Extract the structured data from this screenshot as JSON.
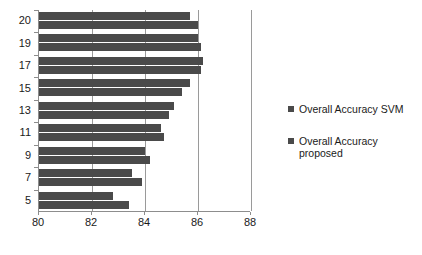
{
  "chart_data": {
    "type": "bar",
    "orientation": "horizontal",
    "title": "",
    "xlabel": "",
    "ylabel": "",
    "xlim": [
      80,
      88
    ],
    "xticks": [
      80,
      82,
      84,
      86,
      88
    ],
    "categories": [
      "20",
      "19",
      "17",
      "15",
      "13",
      "11",
      "9",
      "7",
      "5"
    ],
    "grid": true,
    "legend_position": "right",
    "series": [
      {
        "name": "Overall Accuracy SVM",
        "color": "#4a4a4a",
        "values": [
          85.7,
          86.0,
          86.2,
          85.7,
          85.1,
          84.6,
          84.0,
          83.5,
          82.8
        ]
      },
      {
        "name": "Overall Accuracy\nproposed",
        "color": "#4a4a4a",
        "values": [
          86.0,
          86.1,
          86.1,
          85.4,
          84.9,
          84.7,
          84.2,
          83.9,
          83.4
        ]
      }
    ]
  },
  "legend": {
    "entries": [
      {
        "label": "Overall Accuracy SVM",
        "color": "#4a4a4a"
      },
      {
        "label": "Overall Accuracy\nproposed",
        "color": "#4a4a4a"
      }
    ]
  },
  "axes": {
    "x_tick_labels": [
      "80",
      "82",
      "84",
      "86",
      "88"
    ],
    "y_tick_labels": [
      "20",
      "19",
      "17",
      "15",
      "13",
      "11",
      "9",
      "7",
      "5"
    ]
  },
  "colors": {
    "bar": "#4a4a4a",
    "axis": "#8d8d8d",
    "grid": "#9a9a9a",
    "text": "#1a1a1a",
    "background": "#ffffff"
  }
}
